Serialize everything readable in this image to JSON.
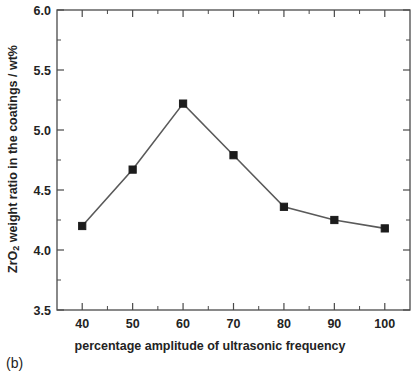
{
  "figure": {
    "panel_label": "(b)",
    "background_color": "#ffffff",
    "frame_color": "#4a4a4a"
  },
  "chart_data": {
    "type": "line",
    "title": "",
    "subtitle": "",
    "xlabel": "percentage amplitude of ultrasonic frequency",
    "ylabel": "ZrO2 weight ratio in the coatings / wt%",
    "ylabel_prefix": "ZrO",
    "ylabel_subscript": "2",
    "ylabel_suffix": " weight ratio in the coatings / wt%",
    "x": [
      40,
      50,
      60,
      70,
      80,
      90,
      100
    ],
    "values": [
      4.2,
      4.67,
      5.22,
      4.79,
      4.36,
      4.25,
      4.18
    ],
    "series": [
      {
        "name": "ZrO2 weight ratio",
        "x": [
          40,
          50,
          60,
          70,
          80,
          90,
          100
        ],
        "values": [
          4.2,
          4.67,
          5.22,
          4.79,
          4.36,
          4.25,
          4.18
        ],
        "line_color": "#5a5a5a",
        "marker_color": "#1c1c1c",
        "marker": "square"
      }
    ],
    "xlim": [
      35,
      105
    ],
    "ylim": [
      3.5,
      6.0
    ],
    "xticks": [
      40,
      50,
      60,
      70,
      80,
      90,
      100
    ],
    "xtick_labels": [
      "40",
      "50",
      "60",
      "70",
      "80",
      "90",
      "100"
    ],
    "yticks": [
      3.5,
      4.0,
      4.5,
      5.0,
      5.5,
      6.0
    ],
    "ytick_labels": [
      "3.5",
      "4.0",
      "4.5",
      "5.0",
      "5.5",
      "6.0"
    ],
    "x_minor_interval": 5,
    "y_minor_interval": 0.25,
    "grid": false,
    "legend": null,
    "legend_position": "none",
    "annotations": []
  }
}
